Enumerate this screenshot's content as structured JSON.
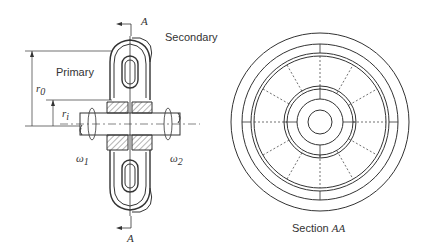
{
  "figure": {
    "left_view": {
      "section_marker_top": "A",
      "section_marker_bottom": "A",
      "secondary_label": "Secondary",
      "primary_label": "Primary",
      "outer_radius_label": "r",
      "outer_radius_sub": "0",
      "inner_radius_label": "r",
      "inner_radius_sub": "i",
      "omega1_label": "ω",
      "omega1_sub": "1",
      "omega2_label": "ω",
      "omega2_sub": "2"
    },
    "right_view": {
      "caption_prefix": "Section ",
      "caption_section": "AA"
    }
  }
}
